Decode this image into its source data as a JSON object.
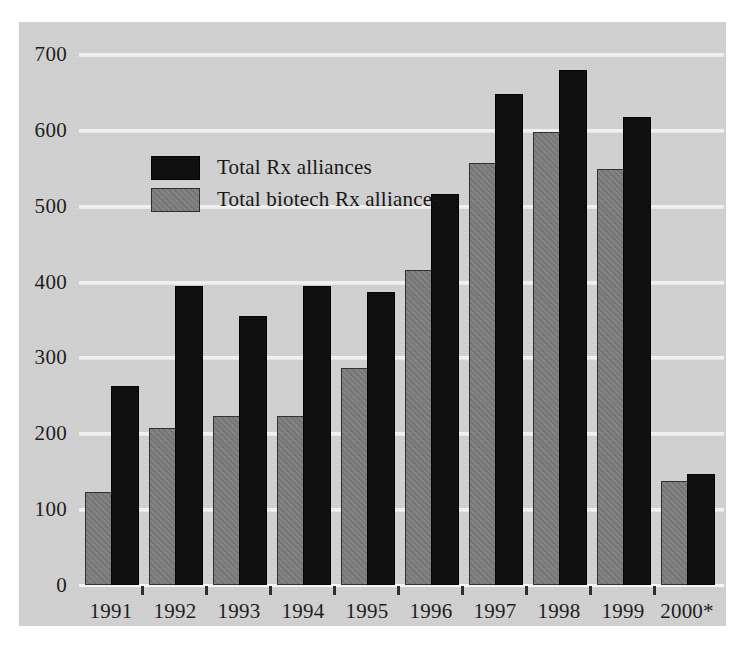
{
  "chart_data": {
    "type": "bar",
    "title": "",
    "xlabel": "",
    "ylabel": "",
    "ylim": [
      0,
      700
    ],
    "yticks": [
      0,
      100,
      200,
      300,
      400,
      500,
      600,
      700
    ],
    "grid": true,
    "legend_position": "inside-top-left",
    "categories": [
      "1991",
      "1992",
      "1993",
      "1994",
      "1995",
      "1996",
      "1997",
      "1998",
      "1999",
      "2000*"
    ],
    "series": [
      {
        "name": "Total biotech Rx alliances",
        "color": "#7b7b7b",
        "values": [
          120,
          205,
          220,
          220,
          283,
          412,
          554,
          595,
          546,
          135
        ]
      },
      {
        "name": "Total Rx alliances",
        "color": "#0c0c0c",
        "values": [
          260,
          392,
          352,
          392,
          384,
          513,
          644,
          676,
          614,
          144
        ]
      }
    ]
  },
  "legend": {
    "entries": [
      {
        "label": "Total Rx alliances",
        "swatch": "black"
      },
      {
        "label": "Total biotech Rx alliances",
        "swatch": "grey"
      }
    ]
  },
  "axes": {
    "y_tick_labels": [
      "700",
      "600",
      "500",
      "400",
      "300",
      "200",
      "100",
      "0"
    ],
    "x_tick_labels": [
      "1991",
      "1992",
      "1993",
      "1994",
      "1995",
      "1996",
      "1997",
      "1998",
      "1999",
      "2000*"
    ]
  },
  "caption": {
    "text": ""
  }
}
